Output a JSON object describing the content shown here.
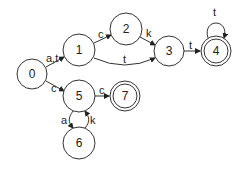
{
  "diagram": {
    "type": "finite-automaton",
    "states": [
      {
        "id": "0",
        "label": "0",
        "accepting": false
      },
      {
        "id": "1",
        "label": "1",
        "accepting": false
      },
      {
        "id": "2",
        "label": "2",
        "accepting": false
      },
      {
        "id": "3",
        "label": "3",
        "accepting": false
      },
      {
        "id": "4",
        "label": "4",
        "accepting": true
      },
      {
        "id": "5",
        "label": "5",
        "accepting": false
      },
      {
        "id": "6",
        "label": "6",
        "accepting": false
      },
      {
        "id": "7",
        "label": "7",
        "accepting": true
      }
    ],
    "transitions": [
      {
        "from": "0",
        "to": "1",
        "label": "a,t"
      },
      {
        "from": "0",
        "to": "5",
        "label": "c"
      },
      {
        "from": "1",
        "to": "2",
        "label": "c"
      },
      {
        "from": "2",
        "to": "3",
        "label": "k"
      },
      {
        "from": "1",
        "to": "3",
        "label": "t"
      },
      {
        "from": "3",
        "to": "4",
        "label": "t"
      },
      {
        "from": "4",
        "to": "4",
        "label": "t"
      },
      {
        "from": "5",
        "to": "7",
        "label": "c"
      },
      {
        "from": "5",
        "to": "6",
        "label": "a"
      },
      {
        "from": "6",
        "to": "5",
        "label": "k"
      }
    ]
  }
}
